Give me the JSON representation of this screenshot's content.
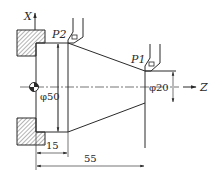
{
  "diagram": {
    "type": "lathe turning diagram",
    "axes": {
      "x_label": "X",
      "z_label": "Z"
    },
    "points": {
      "p1_label": "P1",
      "p2_label": "P2"
    },
    "dimensions": {
      "large_diameter": "φ50",
      "small_diameter": "φ20",
      "shoulder_length": "15",
      "total_length": "55"
    },
    "colors": {
      "line": "#2a2a2a",
      "background": "#ffffff"
    }
  }
}
